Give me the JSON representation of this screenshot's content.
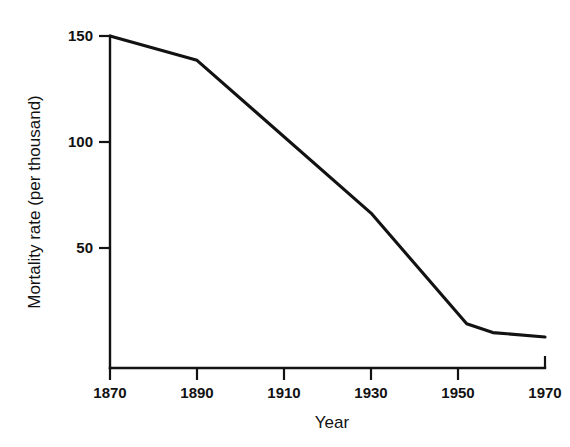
{
  "chart_data": {
    "type": "line",
    "title": "",
    "xlabel": "Year",
    "ylabel": "Mortality rate (per thousand)",
    "xlim": [
      1870,
      1970
    ],
    "ylim": [
      0,
      150
    ],
    "grid": false,
    "legend": false,
    "line_color": "#121212",
    "background_color": "#ffffff",
    "xticks": [
      1870,
      1890,
      1910,
      1930,
      1950,
      1970
    ],
    "xtick_labels": [
      "1870",
      "1890",
      "1910",
      "1930",
      "1950",
      "1970"
    ],
    "yticks": [
      50,
      100,
      150
    ],
    "ytick_labels": [
      "50",
      "100",
      "150"
    ],
    "series": [
      {
        "name": "Mortality rate",
        "x": [
          1870,
          1890,
          1930,
          1952,
          1958,
          1970
        ],
        "values": [
          150,
          139,
          70,
          20,
          16,
          14
        ]
      }
    ]
  },
  "axis": {
    "y_title": "Mortality rate (per thousand)",
    "x_title": "Year"
  }
}
